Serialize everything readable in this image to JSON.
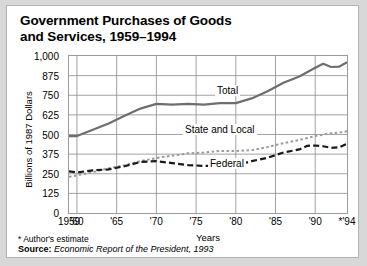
{
  "figure": {
    "title_line1": "Government Purchases of Goods",
    "title_line2": "and Services, 1959–1994",
    "footnote": "* Author's estimate",
    "source_label": "Source:",
    "source_text": "Economic Report of the President, 1993"
  },
  "colors": {
    "panel_background": "#ffffff",
    "page_background": "#d8d8d8",
    "frame_border": "#b4b4b4",
    "plot_border": "#9a9a9a",
    "gridline": "#8c8c8c",
    "total_line": "#6e6e6e",
    "federal_line": "#1a1a1a",
    "state_local_line": "#9b9b9b",
    "text": "#000000"
  },
  "chart_data": {
    "type": "line",
    "title": "Government Purchases of Goods and Services, 1959–1994",
    "xlabel": "Years",
    "ylabel": "Billions of 1987 Dollars",
    "xlim": [
      1959,
      1994
    ],
    "ylim": [
      0,
      1000
    ],
    "yticks": [
      0,
      125,
      250,
      375,
      500,
      625,
      750,
      875,
      1000
    ],
    "ytick_labels": [
      "0",
      "125",
      "250",
      "375",
      "500",
      "625",
      "750",
      "875",
      "1,000"
    ],
    "xticks": [
      1959,
      1960,
      1965,
      1970,
      1975,
      1980,
      1985,
      1990,
      1994
    ],
    "xtick_labels": [
      "1959",
      "'60",
      "'65",
      "'70",
      "'75",
      "'80",
      "'85",
      "'90",
      "*'94"
    ],
    "grid": true,
    "legend_position": "inline-labels",
    "series": [
      {
        "name": "Total",
        "style": "solid",
        "color": "#6e6e6e",
        "x": [
          1959,
          1960,
          1962,
          1964,
          1966,
          1968,
          1970,
          1972,
          1974,
          1976,
          1978,
          1980,
          1982,
          1984,
          1986,
          1988,
          1990,
          1991,
          1992,
          1993,
          1994
        ],
        "values": [
          490,
          490,
          530,
          570,
          620,
          665,
          695,
          690,
          695,
          690,
          700,
          700,
          730,
          775,
          830,
          870,
          925,
          950,
          930,
          932,
          960
        ]
      },
      {
        "name": "State and Local",
        "style": "dotted",
        "color": "#9b9b9b",
        "x": [
          1959,
          1960,
          1962,
          1964,
          1966,
          1968,
          1970,
          1972,
          1974,
          1976,
          1978,
          1980,
          1982,
          1984,
          1986,
          1988,
          1990,
          1991,
          1992,
          1993,
          1994
        ],
        "values": [
          230,
          240,
          260,
          285,
          305,
          330,
          350,
          365,
          380,
          385,
          395,
          395,
          400,
          420,
          445,
          465,
          490,
          500,
          508,
          512,
          520
        ]
      },
      {
        "name": "Federal",
        "style": "dashed",
        "color": "#1a1a1a",
        "x": [
          1959,
          1960,
          1962,
          1964,
          1966,
          1968,
          1970,
          1972,
          1974,
          1976,
          1978,
          1980,
          1982,
          1984,
          1986,
          1988,
          1989,
          1990,
          1991,
          1992,
          1993,
          1994
        ],
        "values": [
          265,
          258,
          272,
          278,
          298,
          325,
          330,
          318,
          305,
          300,
          300,
          305,
          330,
          352,
          385,
          405,
          428,
          430,
          425,
          415,
          418,
          440
        ]
      }
    ],
    "annotations": [
      {
        "text": "Total",
        "x": 1984,
        "y": 800
      },
      {
        "text": "State and Local",
        "x": 1978,
        "y": 560
      },
      {
        "text": "Federal",
        "x": 1983,
        "y": 340
      }
    ]
  }
}
